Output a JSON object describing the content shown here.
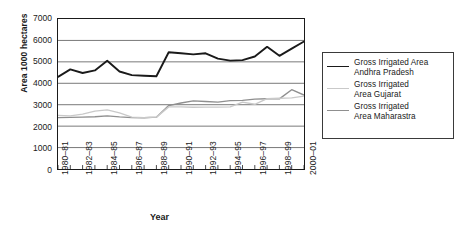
{
  "chart_data": {
    "type": "line",
    "title": "",
    "xlabel": "Year",
    "ylabel": "Area 1000 hectares",
    "ylim": [
      0,
      7000
    ],
    "ytick_labels": [
      "0",
      "1000",
      "2000",
      "3000",
      "4000",
      "5000",
      "6000",
      "7000"
    ],
    "ytick_values": [
      0,
      1000,
      2000,
      3000,
      4000,
      5000,
      6000,
      7000
    ],
    "grid": true,
    "grid_axis": "y",
    "legend_position": "right",
    "x": [
      "1980-81",
      "1981-82",
      "1982-83",
      "1983-84",
      "1984-85",
      "1985-86",
      "1986-87",
      "1987-88",
      "1988-89",
      "1989-90",
      "1990-91",
      "1991-92",
      "1992-93",
      "1993-94",
      "1994-95",
      "1995-96",
      "1996-97",
      "1997-98",
      "1998-99",
      "1999-2000",
      "2000-01"
    ],
    "xtick_labels": [
      "1980–81",
      "1982–83",
      "1984–85",
      "1986–87",
      "1988–89",
      "1990–91",
      "1992–93",
      "1994–95",
      "1996–97",
      "1998–99",
      "2000–01"
    ],
    "xtick_indices": [
      0,
      2,
      4,
      6,
      8,
      10,
      12,
      14,
      16,
      18,
      20
    ],
    "series": [
      {
        "name": "Gross Irrigated Area Andhra Pradesh",
        "legend_line1": "Gross Irrigated Area",
        "legend_line2": "Andhra Pradesh",
        "color": "#1a1a1a",
        "width": 1.9,
        "values": [
          4300,
          4650,
          4480,
          4600,
          5050,
          4550,
          4380,
          4350,
          4330,
          5450,
          5400,
          5350,
          5400,
          5150,
          5060,
          5080,
          5250,
          5700,
          5280,
          5620,
          5950
        ]
      },
      {
        "name": "Gross Irrigated Area Gujarat",
        "legend_line1": "Gross Irrigated",
        "legend_line2": "Area Gujarat",
        "color": "#c9c9c9",
        "width": 1.4,
        "values": [
          2500,
          2480,
          2560,
          2700,
          2760,
          2620,
          2420,
          2400,
          2420,
          2900,
          2900,
          2880,
          2890,
          2890,
          2900,
          3120,
          3020,
          3280,
          3300,
          3320,
          3400
        ]
      },
      {
        "name": "Gross Irrigated Area Maharastra",
        "legend_line1": "Gross Irrigated",
        "legend_line2": "Area Maharastra",
        "color": "#8f8f8f",
        "width": 1.4,
        "values": [
          2400,
          2410,
          2420,
          2440,
          2480,
          2430,
          2400,
          2390,
          2420,
          2960,
          3080,
          3180,
          3150,
          3120,
          3190,
          3200,
          3260,
          3280,
          3270,
          3700,
          3450
        ]
      }
    ]
  }
}
